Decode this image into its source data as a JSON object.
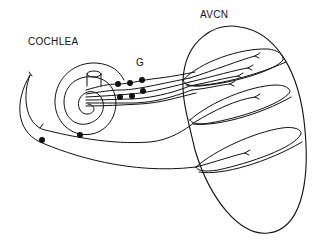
{
  "labels": {
    "cochlea": "COCHLEA",
    "ganglion": "G",
    "nucleus": "AVCN"
  },
  "colors": {
    "ink": "#111111",
    "background": "#ffffff"
  },
  "diagram": {
    "ganglion_cells_count": 9,
    "avcn_laminae_count": 3
  }
}
